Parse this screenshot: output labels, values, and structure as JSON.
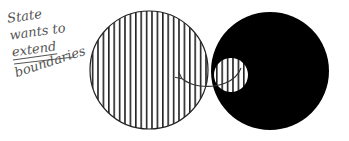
{
  "annotation": {
    "lines": [
      "State",
      "wants to",
      "extend",
      "boundaries"
    ],
    "underlined_line_index": 2
  },
  "shapes": {
    "large_hatched_circle": {
      "cx": 149,
      "cy": 70,
      "r": 59,
      "fill": "vertical-hatch",
      "stroke": "#222222"
    },
    "black_circle": {
      "cx": 270,
      "cy": 71,
      "r": 59,
      "fill": "#000000"
    },
    "small_hatched_circle": {
      "cx": 231,
      "cy": 75,
      "r": 17,
      "fill": "vertical-hatch",
      "background": "#ffffff"
    },
    "arrow": {
      "from": [
        240,
        70
      ],
      "to": [
        180,
        78
      ],
      "color": "#333333"
    }
  },
  "colors": {
    "background": "#ffffff",
    "ink": "#000000",
    "hatch": "#222222",
    "handwriting": "#555555"
  }
}
